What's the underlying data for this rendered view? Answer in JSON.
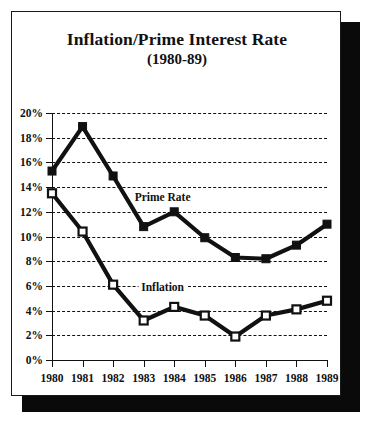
{
  "chart_data": {
    "type": "line",
    "title": "Inflation/Prime Interest Rate",
    "subtitle": "(1980-89)",
    "xlabel": "",
    "ylabel": "",
    "categories": [
      "1980",
      "1981",
      "1982",
      "1983",
      "1984",
      "1985",
      "1986",
      "1987",
      "1988",
      "1989"
    ],
    "ylim": [
      0,
      20
    ],
    "ytick_step": 2,
    "ytick_labels": [
      "0%",
      "2%",
      "4%",
      "6%",
      "8%",
      "10%",
      "12%",
      "14%",
      "16%",
      "18%",
      "20%"
    ],
    "grid": "horizontal-dashed",
    "legend": "inline-annotations",
    "series": [
      {
        "name": "Prime Rate",
        "marker": "filled-square",
        "color": "#111111",
        "values": [
          15.3,
          18.9,
          14.9,
          10.8,
          12.0,
          9.9,
          8.3,
          8.2,
          9.3,
          11.0
        ]
      },
      {
        "name": "Inflation",
        "marker": "hollow-square",
        "color": "#111111",
        "values": [
          13.5,
          10.4,
          6.1,
          3.2,
          4.3,
          3.6,
          1.9,
          3.6,
          4.1,
          4.8
        ]
      }
    ],
    "annotations": [
      {
        "text": "Prime Rate",
        "x_index": 3.62,
        "y_value": 13.2
      },
      {
        "text": "Inflation",
        "x_index": 3.62,
        "y_value": 5.95
      }
    ]
  }
}
